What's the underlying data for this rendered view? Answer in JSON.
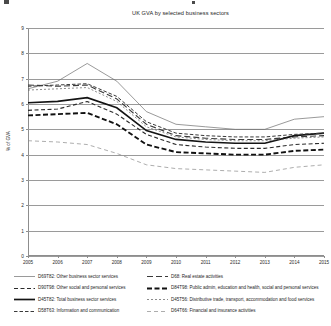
{
  "chart_data": {
    "type": "line",
    "title": "UK GVA by selected business sectors",
    "xlabel": "",
    "ylabel": "% of GVA",
    "x": [
      2005,
      2006,
      2007,
      2008,
      2009,
      2010,
      2011,
      2012,
      2013,
      2014,
      2015
    ],
    "xtick_labels": [
      "2005",
      "2006",
      "2007",
      "2008",
      "2009",
      "2010",
      "2011",
      "2012",
      "2013",
      "2014",
      "2015"
    ],
    "ylim": [
      0,
      9
    ],
    "ytick_labels": [
      "0",
      "1",
      "2",
      "3",
      "4",
      "5",
      "6",
      "7",
      "8",
      "9"
    ],
    "grid": true,
    "legend_position": "bottom",
    "series": [
      {
        "code": "D69T82",
        "name": "D69T82: Other business sector services",
        "style": "solid-thin",
        "color": "#6e6e6e",
        "values": [
          6.6,
          6.9,
          7.6,
          6.9,
          5.7,
          5.2,
          5.1,
          5.0,
          5.0,
          5.4,
          5.5
        ]
      },
      {
        "code": "D68",
        "name": "D68: Real estate activities",
        "style": "dashed-long",
        "color": "#3a3a3a",
        "values": [
          6.75,
          6.7,
          6.75,
          6.2,
          5.2,
          4.75,
          4.65,
          4.6,
          4.6,
          4.7,
          4.75
        ]
      },
      {
        "code": "D90T98",
        "name": "D90T98: Other social and personal services",
        "style": "dashed-medium",
        "color": "#2b2b2b",
        "values": [
          5.75,
          5.8,
          6.1,
          5.6,
          4.8,
          4.4,
          4.3,
          4.25,
          4.25,
          4.4,
          4.45
        ]
      },
      {
        "code": "D84T98",
        "name": "D84T98: Public admin, education and health, social and personal services",
        "style": "dashed-heavy",
        "color": "#111111",
        "values": [
          5.55,
          5.6,
          5.65,
          5.2,
          4.4,
          4.1,
          4.05,
          4.0,
          4.0,
          4.15,
          4.2
        ]
      },
      {
        "code": "D45T82",
        "name": "D45T82: Total business sector services",
        "style": "solid-thick",
        "color": "#141414",
        "values": [
          6.05,
          6.1,
          6.25,
          5.85,
          4.95,
          4.6,
          4.5,
          4.45,
          4.45,
          4.75,
          4.85
        ]
      },
      {
        "code": "D45T56",
        "name": "D45T56: Distributive trade, transport, accommodation and food services",
        "style": "dashed-fine",
        "color": "#5a5a5a",
        "values": [
          6.55,
          6.6,
          6.65,
          6.1,
          5.1,
          4.7,
          4.6,
          4.55,
          4.55,
          4.65,
          4.7
        ]
      },
      {
        "code": "D58T63",
        "name": "D58T63: Information and communication",
        "style": "dashed-medium2",
        "color": "#3a3a3a",
        "values": [
          6.7,
          6.75,
          6.8,
          6.3,
          5.3,
          4.85,
          4.75,
          4.7,
          4.7,
          4.8,
          4.85
        ]
      },
      {
        "code": "D64T66",
        "name": "D64T66: Financial and insurance activities",
        "style": "dashed-sparse",
        "color": "#8a8a8a",
        "values": [
          4.55,
          4.5,
          4.4,
          4.05,
          3.6,
          3.45,
          3.4,
          3.35,
          3.3,
          3.5,
          3.6
        ]
      }
    ]
  }
}
